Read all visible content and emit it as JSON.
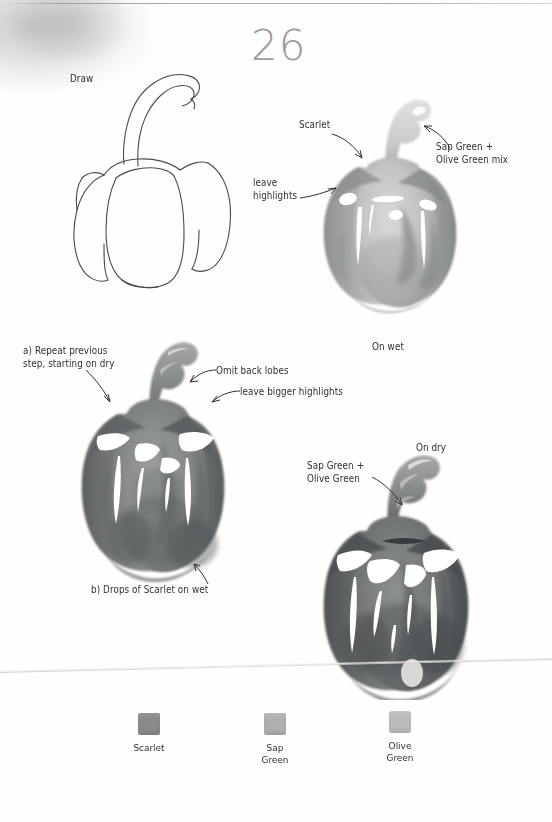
{
  "page": {
    "number": "26",
    "width": 552,
    "height": 822
  },
  "steps": [
    {
      "id": "step-draw",
      "label": "Draw",
      "caption": ""
    },
    {
      "id": "step-on-wet",
      "caption": "On wet",
      "annotations": [
        {
          "name": "scarlet",
          "text": "Scarlet"
        },
        {
          "name": "leave-highlights",
          "text": "leave\nhighlights"
        },
        {
          "name": "sap-olive-mix",
          "text": "Sap Green +\nOlive Green mix"
        }
      ]
    },
    {
      "id": "step-repeat",
      "annotations": [
        {
          "name": "repeat-previous",
          "text": "a) Repeat previous\nstep, starting on dry"
        },
        {
          "name": "omit-back-lobes",
          "text": "Omit back lobes"
        },
        {
          "name": "leave-bigger-highlights",
          "text": "leave bigger highlights"
        },
        {
          "name": "drops-scarlet-on-wet",
          "text": "b) Drops of Scarlet on wet"
        }
      ]
    },
    {
      "id": "step-on-dry",
      "caption": "On dry",
      "annotations": [
        {
          "name": "sap-olive",
          "text": "Sap Green +\nOlive Green"
        }
      ]
    }
  ],
  "palette": {
    "title": "",
    "swatches": [
      {
        "name": "scarlet",
        "label": "Scarlet",
        "color": "#898a8c"
      },
      {
        "name": "sap-green",
        "label": "Sap\nGreen",
        "color": "#aeb0b1"
      },
      {
        "name": "olive-green",
        "label": "Olive\nGreen",
        "color": "#b9bbbc"
      }
    ]
  },
  "colors": {
    "ink": "#2f2f31",
    "line_art": "#4a4a4d",
    "page_number": "#9b9b9e",
    "wash_light": "#c3c5c4",
    "wash_mid": "#9a9c9b",
    "wash_dark": "#6e7070",
    "wash_deep": "#55585a",
    "stem": "#8e9190",
    "paper": "#fefefe"
  }
}
